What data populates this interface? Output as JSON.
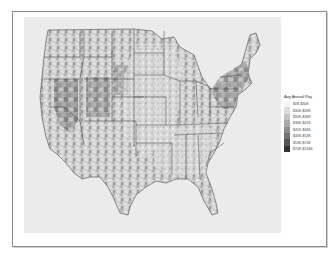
{
  "figure": {
    "type": "choropleth",
    "region": "Contiguous United States (county level)",
    "background_panel_color": "#ebebeb"
  },
  "legend": {
    "title": "Avg Annual Pay",
    "items": [
      {
        "label": "$0K-$30K",
        "color": "#f4f4f4"
      },
      {
        "label": "$30K-$33K",
        "color": "#dcdcdc"
      },
      {
        "label": "$33K-$36K",
        "color": "#c4c4c4"
      },
      {
        "label": "$36K-$41K",
        "color": "#a9a9a9"
      },
      {
        "label": "$41K-$46K",
        "color": "#8e8e8e"
      },
      {
        "label": "$46K-$53K",
        "color": "#737373"
      },
      {
        "label": "$53K-$74K",
        "color": "#555555"
      },
      {
        "label": "$74K-$136K",
        "color": "#333333"
      }
    ]
  }
}
